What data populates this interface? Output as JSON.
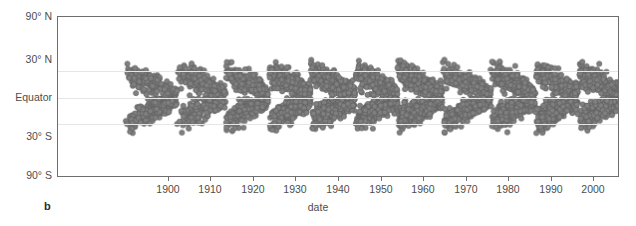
{
  "figure": {
    "panel_label": "b",
    "background_color": "#ffffff",
    "axis_color": "#6e6e6e",
    "grid_color": "#e6e6e6",
    "marker_color": "#808080"
  },
  "chart_data": {
    "type": "scatter",
    "title": "",
    "subtitle": "",
    "xlabel": "date",
    "ylabel": "",
    "xlim": [
      1874,
      2006
    ],
    "ylim": [
      -90,
      90
    ],
    "grid": true,
    "legend": null,
    "x_ticks": [
      1900,
      1910,
      1920,
      1930,
      1940,
      1950,
      1960,
      1970,
      1980,
      1990,
      2000
    ],
    "x_tick_labels": [
      "1900",
      "1910",
      "1920",
      "1930",
      "1940",
      "1950",
      "1960",
      "1970",
      "1980",
      "1990",
      "2000"
    ],
    "y_ticks": [
      90,
      30,
      0,
      -30,
      -90
    ],
    "y_tick_labels": [
      "90° N",
      "30° N",
      "Equator",
      "30° S",
      "90° S"
    ],
    "gridline_values": [
      30,
      0,
      -30
    ],
    "marker": {
      "shape": "circle",
      "size_px": 2.6,
      "fill": "#808080",
      "edge": "#5e5e5e"
    },
    "cycles": [
      {
        "name": "Cycle 13",
        "start": 1890.0,
        "max": 1893.5,
        "end": 1902.0,
        "amplitude": 0.62
      },
      {
        "name": "Cycle 14",
        "start": 1902.0,
        "max": 1906.0,
        "end": 1913.5,
        "amplitude": 0.58
      },
      {
        "name": "Cycle 15",
        "start": 1913.5,
        "max": 1917.5,
        "end": 1923.5,
        "amplitude": 0.82
      },
      {
        "name": "Cycle 16",
        "start": 1923.5,
        "max": 1928.0,
        "end": 1933.5,
        "amplitude": 0.8
      },
      {
        "name": "Cycle 17",
        "start": 1933.5,
        "max": 1937.5,
        "end": 1944.0,
        "amplitude": 1.0
      },
      {
        "name": "Cycle 18",
        "start": 1944.0,
        "max": 1947.5,
        "end": 1954.0,
        "amplitude": 1.05
      },
      {
        "name": "Cycle 19",
        "start": 1954.0,
        "max": 1958.0,
        "end": 1964.5,
        "amplitude": 1.2
      },
      {
        "name": "Cycle 20",
        "start": 1964.5,
        "max": 1968.5,
        "end": 1976.0,
        "amplitude": 0.88
      },
      {
        "name": "Cycle 21",
        "start": 1976.0,
        "max": 1979.5,
        "end": 1986.5,
        "amplitude": 1.05
      },
      {
        "name": "Cycle 22",
        "start": 1986.5,
        "max": 1990.0,
        "end": 1996.5,
        "amplitude": 1.02
      },
      {
        "name": "Cycle 23",
        "start": 1996.5,
        "max": 2000.5,
        "end": 2007.0,
        "amplitude": 0.95
      }
    ]
  }
}
